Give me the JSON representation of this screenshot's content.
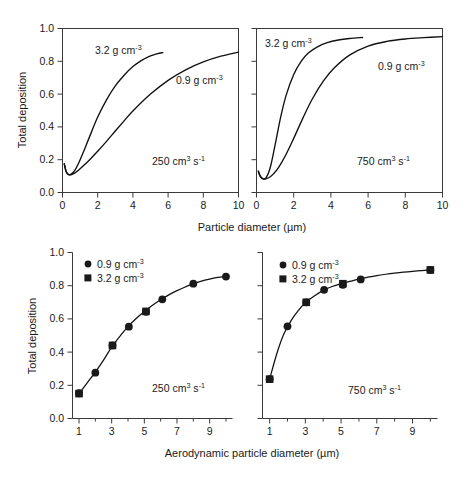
{
  "figure": {
    "background": "#ffffff",
    "ink": "#1a1a1a"
  },
  "chart_data": [
    {
      "id": "top-left",
      "type": "line",
      "title": "",
      "xlabel": "Particle diameter (µm)",
      "ylabel": "Total deposition",
      "xlim": [
        0,
        10
      ],
      "ylim": [
        0.0,
        1.0
      ],
      "xticks": [
        0,
        2,
        4,
        6,
        8,
        10
      ],
      "xticklabels": [
        "0",
        "2",
        "4",
        "6",
        "8",
        "10"
      ],
      "yticks": [
        0.0,
        0.2,
        0.4,
        0.6,
        0.8,
        1.0
      ],
      "yticklabels": [
        "0.0",
        "0.2",
        "0.4",
        "0.6",
        "0.8",
        "1.0"
      ],
      "grid": false,
      "annotation": "250 cm3 s-1",
      "annotation_value": "250",
      "annotation_unit_base": " cm",
      "annotation_unit_sup1": "3",
      "annotation_unit_mid": " s",
      "annotation_unit_sup2": "-1",
      "series": [
        {
          "name": "3.2 g cm-3",
          "label_value": "3.2",
          "label_unit": " g cm",
          "label_sup": "-3",
          "x": [
            0.1,
            0.2,
            0.3,
            0.4,
            0.5,
            0.7,
            0.9,
            1.2,
            1.5,
            2.0,
            2.5,
            3.0,
            3.5,
            4.0,
            4.5,
            5.0,
            5.4,
            5.7
          ],
          "y": [
            0.175,
            0.13,
            0.113,
            0.108,
            0.112,
            0.135,
            0.175,
            0.25,
            0.33,
            0.46,
            0.565,
            0.65,
            0.715,
            0.768,
            0.806,
            0.833,
            0.847,
            0.853
          ]
        },
        {
          "name": "0.9 g cm-3",
          "label_value": "0.9",
          "label_unit": " g cm",
          "label_sup": "-3",
          "x": [
            0.1,
            0.2,
            0.3,
            0.45,
            0.6,
            0.8,
            1.0,
            1.5,
            2.0,
            2.5,
            3.0,
            3.5,
            4.0,
            5.0,
            6.0,
            7.0,
            8.0,
            9.0,
            10.0
          ],
          "y": [
            0.175,
            0.13,
            0.112,
            0.108,
            0.113,
            0.127,
            0.145,
            0.195,
            0.252,
            0.312,
            0.375,
            0.437,
            0.497,
            0.6,
            0.684,
            0.748,
            0.796,
            0.831,
            0.856
          ]
        }
      ]
    },
    {
      "id": "top-right",
      "type": "line",
      "title": "",
      "xlabel": "Particle diameter (µm)",
      "ylabel": "",
      "xlim": [
        0,
        10
      ],
      "ylim": [
        0.0,
        1.0
      ],
      "xticks": [
        0,
        2,
        4,
        6,
        8,
        10
      ],
      "xticklabels": [
        "0",
        "2",
        "4",
        "6",
        "8",
        "10"
      ],
      "yticks": [
        0.0,
        0.2,
        0.4,
        0.6,
        0.8,
        1.0
      ],
      "yticklabels": [],
      "grid": false,
      "annotation": "750 cm3 s-1",
      "annotation_value": "750",
      "annotation_unit_base": " cm",
      "annotation_unit_sup1": "3",
      "annotation_unit_mid": " s",
      "annotation_unit_sup2": "-1",
      "series": [
        {
          "name": "3.2 g cm-3",
          "label_value": "3.2",
          "label_unit": " g cm",
          "label_sup": "-3",
          "x": [
            0.1,
            0.2,
            0.3,
            0.4,
            0.5,
            0.65,
            0.8,
            1.0,
            1.3,
            1.6,
            2.0,
            2.4,
            2.8,
            3.3,
            3.8,
            4.4,
            5.0,
            5.7
          ],
          "y": [
            0.13,
            0.1,
            0.085,
            0.082,
            0.088,
            0.12,
            0.18,
            0.29,
            0.46,
            0.595,
            0.72,
            0.8,
            0.852,
            0.89,
            0.914,
            0.93,
            0.939,
            0.945
          ]
        },
        {
          "name": "0.9 g cm-3",
          "label_value": "0.9",
          "label_unit": " g cm",
          "label_sup": "-3",
          "x": [
            0.1,
            0.2,
            0.35,
            0.5,
            0.7,
            0.9,
            1.2,
            1.6,
            2.0,
            2.5,
            3.0,
            3.6,
            4.2,
            5.0,
            6.0,
            7.0,
            8.0,
            9.0,
            10.0
          ],
          "y": [
            0.13,
            0.1,
            0.084,
            0.083,
            0.093,
            0.112,
            0.155,
            0.235,
            0.33,
            0.455,
            0.57,
            0.68,
            0.762,
            0.838,
            0.893,
            0.921,
            0.936,
            0.944,
            0.95
          ]
        }
      ]
    },
    {
      "id": "bottom-left",
      "type": "scatter",
      "title": "",
      "xlabel": "Aerodynamic particle diameter (µm)",
      "ylabel": "Total deposition",
      "xlim": [
        0.6,
        10.4
      ],
      "ylim": [
        0.0,
        1.0
      ],
      "xticks": [
        1,
        2,
        3,
        4,
        5,
        6,
        7,
        8,
        9,
        10
      ],
      "xticklabels_major": [
        "1",
        "3",
        "5",
        "7",
        "9"
      ],
      "xticks_major": [
        1,
        3,
        5,
        7,
        9
      ],
      "yticks": [
        0.0,
        0.2,
        0.4,
        0.6,
        0.8,
        1.0
      ],
      "yticklabels": [
        "0.0",
        "0.2",
        "0.4",
        "0.6",
        "0.8",
        "1.0"
      ],
      "grid": false,
      "annotation": "250 cm3 s-1",
      "annotation_value": "250",
      "annotation_unit_base": " cm",
      "annotation_unit_sup1": "3",
      "annotation_unit_mid": " s",
      "annotation_unit_sup2": "-1",
      "legend_position": "top-left",
      "legend": [
        {
          "marker": "circle",
          "value": "0.9",
          "unit": " g cm",
          "sup": "-3"
        },
        {
          "marker": "square",
          "value": "3.2",
          "unit": " g cm",
          "sup": "-3"
        }
      ],
      "series": [
        {
          "name": "0.9 g cm-3",
          "marker": "circle",
          "x": [
            1.0,
            2.0,
            3.05,
            4.05,
            5.1,
            6.1,
            8.0,
            10.0
          ],
          "y": [
            0.152,
            0.276,
            0.44,
            0.553,
            0.643,
            0.718,
            0.812,
            0.855
          ]
        },
        {
          "name": "3.2 g cm-3",
          "marker": "square",
          "x": [
            1.0,
            3.05,
            5.1
          ],
          "y": [
            0.15,
            0.44,
            0.645
          ]
        }
      ],
      "fit_curve": {
        "x": [
          1.0,
          1.5,
          2.0,
          2.5,
          3.0,
          3.5,
          4.0,
          4.5,
          5.0,
          5.5,
          6.0,
          6.5,
          7.0,
          7.5,
          8.0,
          8.5,
          9.0,
          9.5,
          10.0
        ],
        "y": [
          0.15,
          0.215,
          0.28,
          0.352,
          0.43,
          0.495,
          0.553,
          0.602,
          0.644,
          0.682,
          0.715,
          0.745,
          0.77,
          0.792,
          0.812,
          0.828,
          0.84,
          0.85,
          0.858
        ]
      }
    },
    {
      "id": "bottom-right",
      "type": "scatter",
      "title": "",
      "xlabel": "Aerodynamic particle diameter (µm)",
      "ylabel": "",
      "xlim": [
        0.6,
        10.4
      ],
      "ylim": [
        0.0,
        1.0
      ],
      "xticks": [
        1,
        2,
        3,
        4,
        5,
        6,
        7,
        8,
        9,
        10
      ],
      "xticklabels_major": [
        "1",
        "3",
        "5",
        "7",
        "9"
      ],
      "xticks_major": [
        1,
        3,
        5,
        7,
        9
      ],
      "yticks": [
        0.0,
        0.2,
        0.4,
        0.6,
        0.8,
        1.0
      ],
      "yticklabels": [],
      "grid": false,
      "annotation": "750 cm3 s-1",
      "annotation_value": "750",
      "annotation_unit_base": " cm",
      "annotation_unit_sup1": "3",
      "annotation_unit_mid": " s",
      "annotation_unit_sup2": "-1",
      "legend_position": "top-left",
      "legend": [
        {
          "marker": "circle",
          "value": "0.9",
          "unit": " g cm",
          "sup": "-3"
        },
        {
          "marker": "square",
          "value": "3.2",
          "unit": " g cm",
          "sup": "-3"
        }
      ],
      "series": [
        {
          "name": "0.9 g cm-3",
          "marker": "circle",
          "x": [
            1.0,
            2.0,
            3.05,
            4.05,
            5.1,
            6.1,
            10.0
          ],
          "y": [
            0.237,
            0.555,
            0.7,
            0.775,
            0.805,
            0.838,
            0.895
          ]
        },
        {
          "name": "3.2 g cm-3",
          "marker": "square",
          "x": [
            1.0,
            3.05,
            5.1,
            10.0
          ],
          "y": [
            0.237,
            0.7,
            0.812,
            0.895
          ]
        }
      ],
      "fit_curve": {
        "x": [
          1.0,
          1.4,
          1.8,
          2.2,
          2.6,
          3.0,
          3.5,
          4.0,
          4.5,
          5.0,
          5.5,
          6.0,
          6.5,
          7.0,
          7.5,
          8.0,
          8.5,
          9.0,
          9.5,
          10.0
        ],
        "y": [
          0.237,
          0.39,
          0.51,
          0.59,
          0.65,
          0.698,
          0.738,
          0.772,
          0.795,
          0.812,
          0.826,
          0.84,
          0.851,
          0.861,
          0.869,
          0.876,
          0.882,
          0.887,
          0.891,
          0.895
        ]
      }
    }
  ]
}
